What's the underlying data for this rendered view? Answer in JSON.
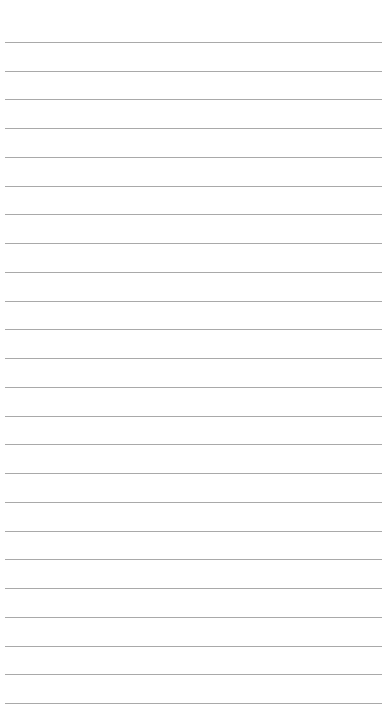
{
  "page": {
    "type": "lined-paper",
    "background_color": "#ffffff",
    "line_color": "#a9a9a9",
    "line_count": 24,
    "first_line_y": 42,
    "line_spacing": 28.74,
    "line_left": 5
  }
}
